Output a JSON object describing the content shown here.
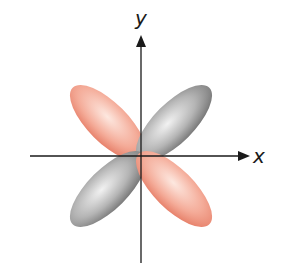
{
  "diagram": {
    "title": "",
    "type": "d_xy orbital",
    "axes": {
      "x_label": "x",
      "y_label": "y"
    },
    "lobes": [
      {
        "position": "upper-left",
        "color": "#f0a08c",
        "phase": "red"
      },
      {
        "position": "upper-right",
        "color": "#9a9a9a",
        "phase": "gray"
      },
      {
        "position": "lower-left",
        "color": "#9a9a9a",
        "phase": "gray"
      },
      {
        "position": "lower-right",
        "color": "#f0a08c",
        "phase": "red"
      }
    ],
    "colors": {
      "red_lobe_light": "#fde1d8",
      "red_lobe_dark": "#e9806a",
      "gray_lobe_light": "#ececec",
      "gray_lobe_dark": "#7a7a7a",
      "axis": "#1a1a1a"
    }
  }
}
